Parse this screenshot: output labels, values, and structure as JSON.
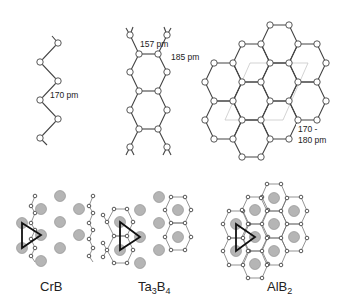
{
  "figure": {
    "top_row": {
      "zigzag_chain": {
        "bond_label": "170 pm"
      },
      "double_chain": {
        "bond_label_a": "157 pm",
        "bond_label_b": "185 pm"
      },
      "honeycomb_layer": {
        "bond_label_line1": "170 -",
        "bond_label_line2": "180 pm"
      }
    },
    "bottom_row": {
      "structures": [
        {
          "name": "CrB",
          "base": "CrB",
          "sub1": "",
          "mid": "",
          "sub2": ""
        },
        {
          "name": "Ta3B4",
          "base": "Ta",
          "sub1": "3",
          "mid": "B",
          "sub2": "4"
        },
        {
          "name": "AlB2",
          "base": "AlB",
          "sub1": "2",
          "mid": "",
          "sub2": ""
        }
      ]
    },
    "colors": {
      "metal_atom": "#b5b5b5",
      "boron_atom": "#ffffff",
      "bond": "#444444",
      "unit_cell": "#c8c8c8"
    }
  }
}
